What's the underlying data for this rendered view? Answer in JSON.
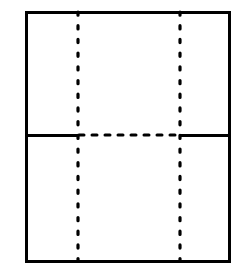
{
  "figure": {
    "title": "",
    "caption": "",
    "background_color": "#ffffff",
    "stroke_color": "#000000",
    "canvas": {
      "width": 243,
      "height": 271
    }
  },
  "outer_rectangle": {
    "name": "outer-panel-boundary",
    "style": "solid",
    "stroke_width": 3,
    "x1": 26,
    "y1": 12,
    "x2": 229,
    "y2": 261
  },
  "vertical_fold_lines": [
    {
      "name": "left-vertical-dotted-fold-line",
      "style": "dotted",
      "x": 78,
      "y1": 12,
      "y2": 261,
      "dot_size": 3.2,
      "dot_gap": 10.5
    },
    {
      "name": "right-vertical-dotted-fold-line",
      "style": "dotted",
      "x": 180,
      "y1": 12,
      "y2": 261,
      "dot_size": 3.2,
      "dot_gap": 10.5
    }
  ],
  "horizontal_line": {
    "name": "horizontal-mid-line",
    "y": 135,
    "segments": [
      {
        "name": "left-solid-segment",
        "style": "solid",
        "stroke_width": 3,
        "x1": 26,
        "x2": 79
      },
      {
        "name": "center-dashed-segment",
        "style": "dashed",
        "stroke_width": 3,
        "x1": 79,
        "x2": 180,
        "dash_length": 5,
        "dash_gap": 8
      },
      {
        "name": "right-solid-segment",
        "style": "solid",
        "stroke_width": 3,
        "x1": 180,
        "x2": 229
      }
    ]
  },
  "panels": [
    {
      "name": "top-left-panel",
      "label": ""
    },
    {
      "name": "top-center-panel",
      "label": ""
    },
    {
      "name": "top-right-panel",
      "label": ""
    },
    {
      "name": "bottom-left-panel",
      "label": ""
    },
    {
      "name": "bottom-center-panel",
      "label": ""
    },
    {
      "name": "bottom-right-panel",
      "label": ""
    }
  ]
}
